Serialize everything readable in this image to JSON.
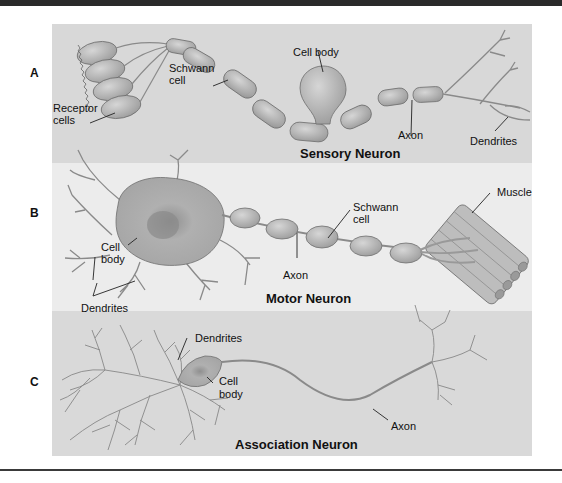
{
  "figure": {
    "panels": [
      {
        "letter": "A",
        "title": "Sensory Neuron",
        "labels": {
          "receptor_cells": [
            "Receptor",
            "cells"
          ],
          "schwann_cell": [
            "Schwann",
            "cell"
          ],
          "cell_body": "Cell body",
          "axon": "Axon",
          "dendrites": "Dendrites"
        }
      },
      {
        "letter": "B",
        "title": "Motor Neuron",
        "labels": {
          "cell_body": [
            "Cell",
            "body"
          ],
          "dendrites": "Dendrites",
          "axon": "Axon",
          "schwann_cell": [
            "Schwann",
            "cell"
          ],
          "muscle": "Muscle"
        }
      },
      {
        "letter": "C",
        "title": "Association Neuron",
        "labels": {
          "dendrites": "Dendrites",
          "cell_body": [
            "Cell",
            "body"
          ],
          "axon": "Axon"
        }
      }
    ],
    "colors": {
      "panel_a_bg": "#d8d8d8",
      "panel_b_bg": "#ececec",
      "panel_c_bg": "#d9d9d9",
      "cell_fill": "#b5b5b5",
      "cell_stroke": "#6e6e6e",
      "line": "#777777"
    }
  }
}
